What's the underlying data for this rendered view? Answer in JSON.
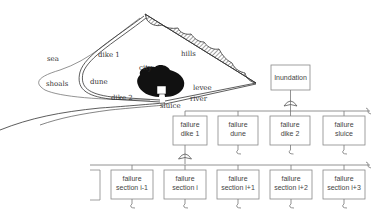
{
  "map": {
    "labels": {
      "sea": "sea",
      "dike1": "dike 1",
      "hills": "hills",
      "shoals": "shoals",
      "dune": "dune",
      "city": "city",
      "levee": "levee",
      "dike2": "dike 2",
      "river": "river",
      "sluice": "sluice"
    }
  },
  "fault_tree": {
    "top_event": {
      "line1": "Inundation"
    },
    "level1": [
      {
        "line1": "failure",
        "line2": "dike 1"
      },
      {
        "line1": "failure",
        "line2": "dune"
      },
      {
        "line1": "failure",
        "line2": "dike 2"
      },
      {
        "line1": "failure",
        "line2": "sluice"
      }
    ],
    "level2": [
      {
        "line1": "failure",
        "line2": "section i-1"
      },
      {
        "line1": "failure",
        "line2": "section i"
      },
      {
        "line1": "failure",
        "line2": "section i+1"
      },
      {
        "line1": "failure",
        "line2": "section i+2"
      },
      {
        "line1": "failure",
        "line2": "section i+3"
      }
    ],
    "gate_type": "OR"
  }
}
